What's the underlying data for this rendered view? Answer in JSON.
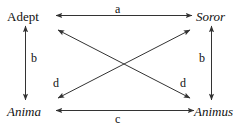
{
  "diagram": {
    "stroke_color": "#333333",
    "text_color": "#111111",
    "background_color": "#ffffff",
    "nodes": [
      {
        "id": "adept",
        "label": "Adept",
        "style": "upright",
        "position": "top-left"
      },
      {
        "id": "soror",
        "label": "Soror",
        "style": "italic",
        "position": "top-right"
      },
      {
        "id": "anima",
        "label": "Anima",
        "style": "italic",
        "position": "bottom-left"
      },
      {
        "id": "animus",
        "label": "Animus",
        "style": "italic",
        "position": "bottom-right"
      }
    ],
    "edges": [
      {
        "id": "a",
        "label": "a",
        "from": "adept",
        "to": "soror",
        "kind": "horizontal-top",
        "arrows": "double"
      },
      {
        "id": "b-left",
        "label": "b",
        "from": "adept",
        "to": "anima",
        "kind": "vertical-left",
        "arrows": "double"
      },
      {
        "id": "b-right",
        "label": "b",
        "from": "soror",
        "to": "animus",
        "kind": "vertical-right",
        "arrows": "double"
      },
      {
        "id": "c",
        "label": "c",
        "from": "anima",
        "to": "animus",
        "kind": "horizontal-bottom",
        "arrows": "double"
      },
      {
        "id": "d-left",
        "label": "d",
        "from": "adept",
        "to": "animus",
        "kind": "diagonal-down",
        "arrows": "double"
      },
      {
        "id": "d-right",
        "label": "d",
        "from": "anima",
        "to": "soror",
        "kind": "diagonal-up",
        "arrows": "double"
      }
    ]
  }
}
